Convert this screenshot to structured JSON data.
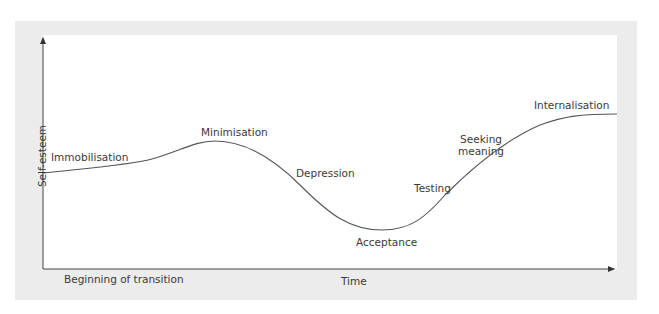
{
  "diagram": {
    "type": "transition-curve",
    "y_axis_label": "Self-esteem",
    "x_axis_label": "Time",
    "x_axis_start_label": "Beginning of transition",
    "stages": [
      {
        "id": "immobilisation",
        "label": "Immobilisation"
      },
      {
        "id": "minimisation",
        "label": "Minimisation"
      },
      {
        "id": "depression",
        "label": "Depression"
      },
      {
        "id": "acceptance",
        "label": "Acceptance"
      },
      {
        "id": "testing",
        "label": "Testing"
      },
      {
        "id": "seeking-meaning",
        "label_line1": "Seeking",
        "label_line2": "meaning"
      },
      {
        "id": "internalisation",
        "label": "Internalisation"
      }
    ],
    "colors": {
      "frame": "#ececec",
      "plot": "#ffffff",
      "curve": "#555555",
      "axis": "#444444",
      "text": "#3a3a3a"
    }
  }
}
